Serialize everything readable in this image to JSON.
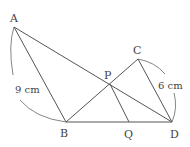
{
  "diagram": {
    "type": "geometry",
    "points": {
      "A": {
        "label": "A",
        "x": 14,
        "y": 27
      },
      "B": {
        "label": "B",
        "x": 66,
        "y": 122
      },
      "C": {
        "label": "C",
        "x": 138,
        "y": 59
      },
      "D": {
        "label": "D",
        "x": 172,
        "y": 122
      },
      "P": {
        "label": "P",
        "x": 110,
        "y": 84
      },
      "Q": {
        "label": "Q",
        "x": 129,
        "y": 122
      }
    },
    "segments": [
      [
        "A",
        "B"
      ],
      [
        "A",
        "D"
      ],
      [
        "B",
        "C"
      ],
      [
        "C",
        "D"
      ],
      [
        "B",
        "D"
      ],
      [
        "P",
        "Q"
      ]
    ],
    "measurements": {
      "AB": "9 cm",
      "CD": "6 cm"
    }
  }
}
